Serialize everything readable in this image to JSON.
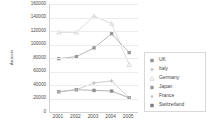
{
  "chart_data": {
    "type": "line",
    "title": "",
    "xlabel": "",
    "ylabel": "Arrivals",
    "categories": [
      "2001",
      "2002",
      "2003",
      "2004",
      "2005"
    ],
    "x": [
      2001,
      2002,
      2003,
      2004,
      2005
    ],
    "ylim": [
      0,
      160000
    ],
    "yticks": [
      0,
      20000,
      40000,
      60000,
      80000,
      100000,
      120000,
      140000,
      160000
    ],
    "ytick_labels": [
      "0",
      "20000",
      "40000",
      "60000",
      "80000",
      "100000",
      "120000",
      "140000",
      "160000"
    ],
    "grid": true,
    "legend_position": "right",
    "series": [
      {
        "name": "UK",
        "values": [
          30000,
          33000,
          32000,
          31000,
          21000
        ],
        "color": "#8f8f8f",
        "marker": "square"
      },
      {
        "name": "Italy",
        "values": [
          30000,
          33000,
          43000,
          46000,
          21000
        ],
        "color": "#b9b9b9",
        "marker": "plus"
      },
      {
        "name": "Germany",
        "values": [
          118000,
          118000,
          142000,
          131000,
          70000
        ],
        "color": "#cfcfcf",
        "marker": "triangle"
      },
      {
        "name": "Japan",
        "values": [
          79000,
          82000,
          95000,
          116000,
          88000
        ],
        "color": "#9a9a9a",
        "marker": "square"
      },
      {
        "name": "France",
        "values": [
          null,
          null,
          null,
          null,
          null
        ],
        "color": "#c2c2c2",
        "marker": "dot"
      },
      {
        "name": "Switzerland",
        "values": [
          null,
          null,
          null,
          null,
          null
        ],
        "color": "#7d7d7d",
        "marker": "square"
      }
    ]
  },
  "legend": {
    "items": [
      {
        "label": "UK"
      },
      {
        "label": "Italy"
      },
      {
        "label": "Germany"
      },
      {
        "label": "Japan"
      },
      {
        "label": "France"
      },
      {
        "label": "Switzerland"
      }
    ]
  }
}
